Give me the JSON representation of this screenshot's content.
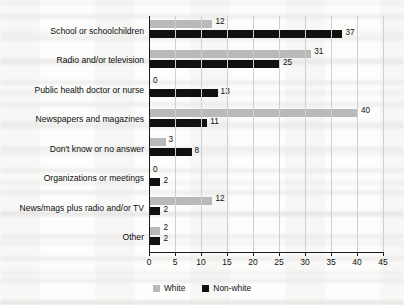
{
  "chart_data": {
    "type": "bar",
    "orientation": "horizontal",
    "title": "",
    "xlabel": "",
    "ylabel": "",
    "xlim": [
      0,
      45
    ],
    "xticks": [
      0,
      5,
      10,
      15,
      20,
      25,
      30,
      35,
      40,
      45
    ],
    "grid": "vertical",
    "legend_position": "bottom-center",
    "categories": [
      "School or schoolchildren",
      "Radio and/or television",
      "Public health doctor or nurse",
      "Newspapers and magazines",
      "Don't know or no answer",
      "Organizations or meetings",
      "News/mags plus radio and/or TV",
      "Other"
    ],
    "series": [
      {
        "name": "White",
        "color": "#b9b9b9",
        "values": [
          12,
          31,
          0,
          40,
          3,
          0,
          12,
          2
        ]
      },
      {
        "name": "Non-white",
        "color": "#111111",
        "values": [
          37,
          25,
          13,
          11,
          8,
          2,
          2,
          2
        ]
      }
    ]
  },
  "legend": {
    "items": [
      {
        "label": "White",
        "swatch": "white-swatch-icon"
      },
      {
        "label": "Non-white",
        "swatch": "nonwhite-swatch-icon"
      }
    ]
  }
}
